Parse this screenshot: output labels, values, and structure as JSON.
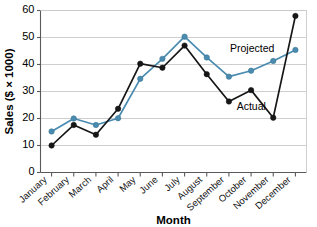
{
  "chart_data": {
    "type": "line",
    "title": "",
    "xlabel": "Month",
    "ylabel": "Sales ($ × 1000)",
    "categories": [
      "January",
      "February",
      "March",
      "April",
      "May",
      "June",
      "July",
      "August",
      "September",
      "October",
      "November",
      "December"
    ],
    "series": [
      {
        "name": "Actual",
        "color": "#161616",
        "values": [
          10.0,
          17.6,
          14.0,
          23.6,
          40.3,
          38.8,
          47.0,
          36.4,
          26.3,
          30.5,
          20.3,
          58.0
        ]
      },
      {
        "name": "Projected",
        "color": "#4a8bb0",
        "values": [
          15.2,
          20.0,
          17.6,
          20.1,
          34.7,
          42.1,
          50.3,
          42.6,
          35.5,
          37.7,
          41.3,
          45.4
        ]
      }
    ],
    "ylim": [
      0,
      60
    ],
    "yticks": [
      0,
      10,
      20,
      30,
      40,
      50,
      60
    ],
    "ytick_labels": [
      "0",
      "10",
      "20",
      "30",
      "40",
      "50",
      "60"
    ],
    "grid": true,
    "grid_axis": "y",
    "legend": "inline-annotations",
    "annotations": [
      {
        "name": "projected-label",
        "text": "Projected",
        "value_x": 8.05,
        "value_y": 44.8
      },
      {
        "name": "actual-label",
        "text": "Actual",
        "value_x": 8.35,
        "value_y": 23.2
      }
    ]
  }
}
